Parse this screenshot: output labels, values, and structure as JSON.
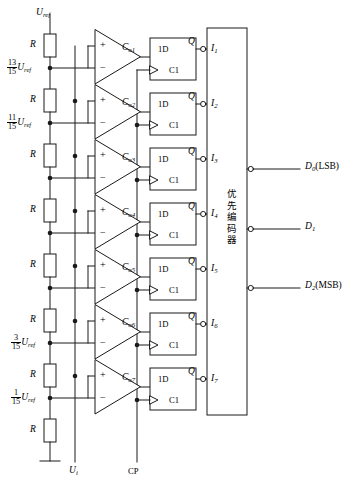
{
  "figure": {
    "type": "circuit-diagram",
    "supply_label": "U",
    "supply_sub": "ref",
    "resistor_label": "R",
    "input_signal": {
      "label": "U",
      "sub": "i"
    },
    "clock": {
      "label": "CP"
    },
    "ground": {
      "name": "ground-symbol"
    }
  },
  "ladder": {
    "resistor_label": "R",
    "resistor_count": 8,
    "taps": [
      {
        "index": 1,
        "numerator": "13",
        "denominator": "15",
        "unit": "U",
        "unit_sub": "ref",
        "shown": true
      },
      {
        "index": 2,
        "numerator": "11",
        "denominator": "15",
        "unit": "U",
        "unit_sub": "ref",
        "shown": true
      },
      {
        "index": 3,
        "numerator": "9",
        "denominator": "15",
        "unit": "U",
        "unit_sub": "ref",
        "shown": false
      },
      {
        "index": 4,
        "numerator": "7",
        "denominator": "15",
        "unit": "U",
        "unit_sub": "ref",
        "shown": false
      },
      {
        "index": 5,
        "numerator": "5",
        "denominator": "15",
        "unit": "U",
        "unit_sub": "ref",
        "shown": false
      },
      {
        "index": 6,
        "numerator": "3",
        "denominator": "15",
        "unit": "U",
        "unit_sub": "ref",
        "shown": true
      },
      {
        "index": 7,
        "numerator": "1",
        "denominator": "15",
        "unit": "U",
        "unit_sub": "ref",
        "shown": true
      }
    ]
  },
  "comparators": [
    {
      "label": "C",
      "sub": "o1",
      "plus": "+",
      "minus": "−"
    },
    {
      "label": "C",
      "sub": "o2",
      "plus": "+",
      "minus": "−"
    },
    {
      "label": "C",
      "sub": "o3",
      "plus": "+",
      "minus": "−"
    },
    {
      "label": "C",
      "sub": "o4",
      "plus": "+",
      "minus": "−"
    },
    {
      "label": "C",
      "sub": "o5",
      "plus": "+",
      "minus": "−"
    },
    {
      "label": "C",
      "sub": "o6",
      "plus": "+",
      "minus": "−"
    },
    {
      "label": "C",
      "sub": "o7",
      "plus": "+",
      "minus": "−"
    }
  ],
  "flipflops": [
    {
      "d_label": "1D",
      "c_label": "C1",
      "q_label": "Q"
    },
    {
      "d_label": "1D",
      "c_label": "C1",
      "q_label": "Q"
    },
    {
      "d_label": "1D",
      "c_label": "C1",
      "q_label": "Q"
    },
    {
      "d_label": "1D",
      "c_label": "C1",
      "q_label": "Q"
    },
    {
      "d_label": "1D",
      "c_label": "C1",
      "q_label": "Q"
    },
    {
      "d_label": "1D",
      "c_label": "C1",
      "q_label": "Q"
    },
    {
      "d_label": "1D",
      "c_label": "C1",
      "q_label": "Q"
    }
  ],
  "encoder": {
    "name_cn": "优先编码器",
    "name_chars": [
      "优",
      "先",
      "编",
      "码",
      "器"
    ],
    "inputs": [
      {
        "label": "I",
        "sub": "1"
      },
      {
        "label": "I",
        "sub": "2"
      },
      {
        "label": "I",
        "sub": "3"
      },
      {
        "label": "I",
        "sub": "4"
      },
      {
        "label": "I",
        "sub": "5"
      },
      {
        "label": "I",
        "sub": "6"
      },
      {
        "label": "I",
        "sub": "7"
      }
    ],
    "outputs": [
      {
        "label": "D",
        "sub": "0",
        "note": "(LSB)"
      },
      {
        "label": "D",
        "sub": "1",
        "note": ""
      },
      {
        "label": "D",
        "sub": "2",
        "note": "(MSB)"
      }
    ]
  },
  "colors": {
    "line": "#1a1a1a",
    "background": "#ffffff",
    "text": "#000000"
  }
}
